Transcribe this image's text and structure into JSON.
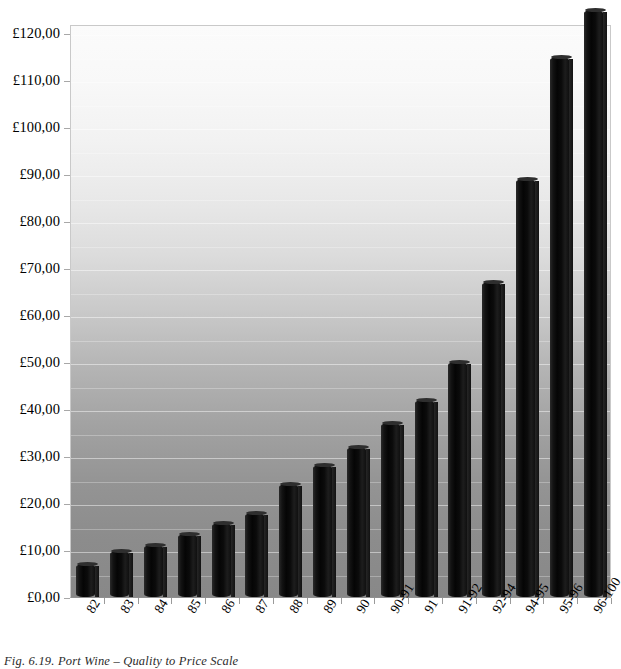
{
  "caption": "Fig. 6.19. Port Wine – Quality to Price Scale",
  "chart_data": {
    "type": "bar",
    "title": "Port Wine – Quality to Price Scale",
    "xlabel": "",
    "ylabel": "",
    "ylim": [
      0,
      120
    ],
    "grid": true,
    "legend": null,
    "currency_symbol": "£",
    "decimal_separator": ",",
    "categories": [
      "82",
      "83",
      "84",
      "85",
      "86",
      "87",
      "88",
      "89",
      "90",
      "90-91",
      "91",
      "91-92",
      "92-94",
      "94-95",
      "95-96",
      "96-100"
    ],
    "values": [
      7,
      9.8,
      11,
      13.5,
      15.7,
      17.8,
      24,
      28,
      32,
      37,
      42,
      50,
      67,
      89,
      115,
      125
    ],
    "value_labels": [
      "£7,00",
      "£9,80",
      "£11,00",
      "£13,50",
      "£15,70",
      "£17,80",
      "£24,00",
      "£28,00",
      "£32,00",
      "£37,00",
      "£42,00",
      "£50,00",
      "£67,00",
      "£89,00",
      "£115,00",
      "£125,00"
    ],
    "ytick_labels": [
      "£120,00",
      "£110,00",
      "£100,00",
      "£90,00",
      "£80,00",
      "£70,00",
      "£60,00",
      "£50,00",
      "£40,00",
      "£30,00",
      "£20,00",
      "£10,00",
      "£0,00"
    ],
    "ytick_values": [
      120,
      110,
      100,
      90,
      80,
      70,
      60,
      50,
      40,
      30,
      20,
      10,
      0
    ],
    "colors": {
      "bar": "#0a0a0a",
      "plot_background_top": "#fbfbfb",
      "plot_background_bottom": "#888888",
      "gridline": "#ffffff",
      "axis": "#8f8f8f",
      "text": "#000000"
    }
  }
}
